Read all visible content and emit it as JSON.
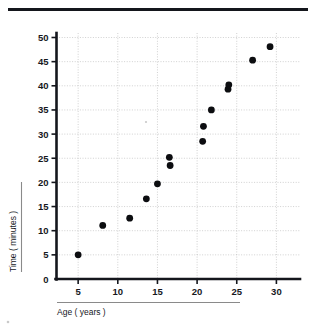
{
  "figure": {
    "top_rule": "horizontal-rule"
  },
  "axes": {
    "x_title": "Age ( years )",
    "y_title": "Time ( minutes )",
    "x_ticks": [
      "5",
      "10",
      "15",
      "20",
      "25",
      "30"
    ],
    "y_ticks": [
      "0",
      "5",
      "10",
      "15",
      "20",
      "25",
      "30",
      "35",
      "40",
      "45",
      "50"
    ]
  },
  "chart_data": {
    "type": "scatter",
    "title": "",
    "xlabel": "Age ( years )",
    "ylabel": "Time ( minutes )",
    "xlim": [
      2.5,
      32.5
    ],
    "ylim": [
      0,
      52.5
    ],
    "xticks": [
      5,
      10,
      15,
      20,
      25,
      30
    ],
    "yticks": [
      0,
      5,
      10,
      15,
      20,
      25,
      30,
      35,
      40,
      45,
      50
    ],
    "grid": true,
    "legend": "none",
    "marker": "filled-circle",
    "marker_color": "#0c0d10",
    "points": [
      {
        "x": 5.0,
        "y": 5.0
      },
      {
        "x": 8.1,
        "y": 11.1
      },
      {
        "x": 11.5,
        "y": 12.6
      },
      {
        "x": 13.6,
        "y": 16.6
      },
      {
        "x": 15.0,
        "y": 19.7
      },
      {
        "x": 16.5,
        "y": 25.2
      },
      {
        "x": 16.6,
        "y": 23.5
      },
      {
        "x": 20.7,
        "y": 28.5
      },
      {
        "x": 20.8,
        "y": 31.6
      },
      {
        "x": 21.8,
        "y": 35.0
      },
      {
        "x": 23.9,
        "y": 39.3
      },
      {
        "x": 24.0,
        "y": 40.2
      },
      {
        "x": 27.0,
        "y": 45.3
      },
      {
        "x": 29.2,
        "y": 48.1
      }
    ]
  }
}
